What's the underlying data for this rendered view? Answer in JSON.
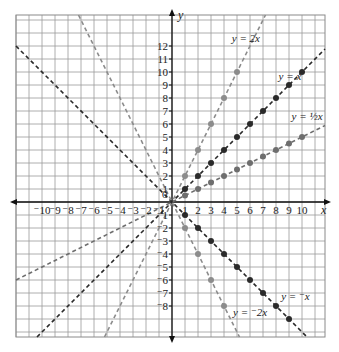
{
  "chart_data": {
    "type": "line",
    "title": "",
    "xlabel": "x",
    "ylabel": "y",
    "xlim": [
      -12,
      12
    ],
    "ylim": [
      -10,
      14
    ],
    "grid": true,
    "x_ticks": [
      -10,
      -9,
      -8,
      -7,
      -6,
      -5,
      -4,
      -3,
      -2,
      -1,
      1,
      2,
      3,
      4,
      5,
      6,
      7,
      8,
      9,
      10
    ],
    "x_tick_labels": [
      "⁻10",
      "⁻9",
      "⁻8",
      "⁻7",
      "⁻6",
      "⁻5",
      "⁻4",
      "⁻3",
      "⁻2",
      "⁻1",
      "1",
      "2",
      "3",
      "4",
      "5",
      "6",
      "7",
      "8",
      "9",
      "10"
    ],
    "y_ticks": [
      12,
      11,
      10,
      9,
      8,
      7,
      6,
      5,
      4,
      3,
      2,
      1,
      -1,
      -2,
      -3,
      -4,
      -5,
      -6,
      -7,
      -8
    ],
    "y_tick_labels": [
      "12",
      "11",
      "10",
      "9",
      "8",
      "7",
      "6",
      "5",
      "4",
      "3",
      "2",
      "1",
      "⁻1",
      "⁻2",
      "⁻3",
      "⁻4",
      "⁻5",
      "⁻6",
      "⁻7",
      "⁻8"
    ],
    "origin_label": "0",
    "series": [
      {
        "name": "y = 2x",
        "slope": 2,
        "color": "#8c8c8c",
        "label_pos": [
          4.6,
          12.3
        ],
        "points": [
          [
            1,
            2
          ],
          [
            2,
            4
          ],
          [
            3,
            6
          ],
          [
            4,
            8
          ],
          [
            5,
            10
          ]
        ]
      },
      {
        "name": "y = x",
        "slope": 1,
        "color": "#2a2a2a",
        "label_pos": [
          8.2,
          9.4
        ],
        "points": [
          [
            1,
            1
          ],
          [
            2,
            2
          ],
          [
            3,
            3
          ],
          [
            4,
            4
          ],
          [
            5,
            5
          ],
          [
            6,
            6
          ],
          [
            7,
            7
          ],
          [
            8,
            8
          ],
          [
            9,
            9
          ],
          [
            10,
            10
          ]
        ]
      },
      {
        "name": "y = ½x",
        "slope": 0.5,
        "color": "#6e6e6e",
        "label_pos": [
          9.2,
          6.3
        ],
        "points": [
          [
            1,
            0.5
          ],
          [
            2,
            1
          ],
          [
            3,
            1.5
          ],
          [
            4,
            2
          ],
          [
            5,
            2.5
          ],
          [
            6,
            3
          ],
          [
            7,
            3.5
          ],
          [
            8,
            4
          ],
          [
            9,
            4.5
          ],
          [
            10,
            5
          ]
        ]
      },
      {
        "name": "y = ⁻x",
        "slope": -1,
        "color": "#2a2a2a",
        "label_pos": [
          8.4,
          -7.5
        ],
        "points": [
          [
            1,
            -1
          ],
          [
            2,
            -2
          ],
          [
            3,
            -3
          ],
          [
            4,
            -4
          ],
          [
            5,
            -5
          ],
          [
            6,
            -6
          ],
          [
            7,
            -7
          ],
          [
            8,
            -8
          ],
          [
            9,
            -9
          ]
        ]
      },
      {
        "name": "y = ⁻2x",
        "slope": -2,
        "color": "#8c8c8c",
        "label_pos": [
          4.7,
          -8.8
        ],
        "points": [
          [
            1,
            -2
          ],
          [
            2,
            -4
          ],
          [
            3,
            -6
          ],
          [
            4,
            -8
          ]
        ]
      }
    ]
  }
}
